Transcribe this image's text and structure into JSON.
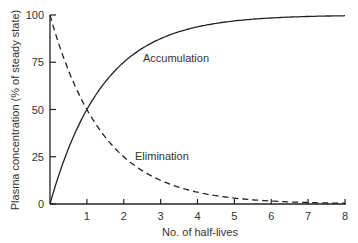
{
  "chart_data": {
    "type": "line",
    "title": "",
    "xlabel": "No. of half-lives",
    "ylabel": "Plasma concentration (% of steady state)",
    "xlim": [
      0,
      8
    ],
    "ylim": [
      0,
      100
    ],
    "x_ticks": [
      "1",
      "2",
      "3",
      "4",
      "5",
      "6",
      "7",
      "8"
    ],
    "y_ticks": [
      "0",
      "25",
      "50",
      "75",
      "100"
    ],
    "grid": false,
    "series": [
      {
        "name": "Accumulation",
        "style": "solid",
        "x": [
          0,
          1,
          2,
          3,
          4,
          5,
          6,
          7,
          8
        ],
        "values": [
          0,
          50,
          75,
          87.5,
          93.75,
          96.9,
          98.4,
          99.2,
          99.6
        ]
      },
      {
        "name": "Elimination",
        "style": "dashed",
        "x": [
          0,
          1,
          2,
          3,
          4,
          5,
          6,
          7,
          8
        ],
        "values": [
          100,
          50,
          25,
          12.5,
          6.25,
          3.1,
          1.6,
          0.8,
          0.4
        ]
      }
    ],
    "annotations": [
      "Accumulation",
      "Elimination"
    ]
  }
}
